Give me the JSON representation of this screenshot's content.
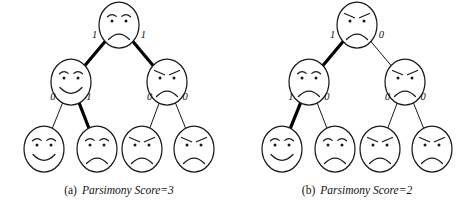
{
  "figure": {
    "type": "phylogenetic-parsimony-diagram",
    "panel_count": 2
  },
  "panels": [
    {
      "id": "a",
      "caption_tag": "(a)",
      "caption_text": "Parsimony Score=3",
      "nodes": {
        "root": {
          "face": "sad",
          "label": "root-node"
        },
        "internal_left": {
          "face": "happy",
          "label": "internal-node-left"
        },
        "internal_right": {
          "face": "angry",
          "label": "internal-node-right"
        },
        "leaf_1": {
          "face": "happy",
          "label": "leaf-node-1"
        },
        "leaf_2": {
          "face": "sad",
          "label": "leaf-node-2"
        },
        "leaf_3": {
          "face": "angry",
          "label": "leaf-node-3"
        },
        "leaf_4": {
          "face": "angry",
          "label": "leaf-node-4"
        }
      },
      "edges": [
        {
          "id": "root-left",
          "label": "1",
          "weight": "bold"
        },
        {
          "id": "root-right",
          "label": "1",
          "weight": "bold"
        },
        {
          "id": "left-leaf1",
          "label": "0",
          "weight": "thin"
        },
        {
          "id": "left-leaf2",
          "label": "1",
          "weight": "bold"
        },
        {
          "id": "right-leaf3",
          "label": "0",
          "weight": "thin"
        },
        {
          "id": "right-leaf4",
          "label": "0",
          "weight": "thin"
        }
      ]
    },
    {
      "id": "b",
      "caption_tag": "(b)",
      "caption_text": "Parsimony Score=2",
      "nodes": {
        "root": {
          "face": "angry",
          "label": "root-node"
        },
        "internal_left": {
          "face": "sad",
          "label": "internal-node-left"
        },
        "internal_right": {
          "face": "angry",
          "label": "internal-node-right"
        },
        "leaf_1": {
          "face": "happy",
          "label": "leaf-node-1"
        },
        "leaf_2": {
          "face": "sad",
          "label": "leaf-node-2"
        },
        "leaf_3": {
          "face": "angry",
          "label": "leaf-node-3"
        },
        "leaf_4": {
          "face": "angry",
          "label": "leaf-node-4"
        }
      },
      "edges": [
        {
          "id": "root-left",
          "label": "1",
          "weight": "bold"
        },
        {
          "id": "root-right",
          "label": "0",
          "weight": "thin"
        },
        {
          "id": "left-leaf1",
          "label": "1",
          "weight": "bold"
        },
        {
          "id": "left-leaf2",
          "label": "0",
          "weight": "thin"
        },
        {
          "id": "right-leaf3",
          "label": "0",
          "weight": "thin"
        },
        {
          "id": "right-leaf4",
          "label": "0",
          "weight": "thin"
        }
      ]
    }
  ],
  "colors": {
    "ink": "#1a1a1a",
    "bold_edge": "#000000",
    "background": "#ffffff"
  }
}
